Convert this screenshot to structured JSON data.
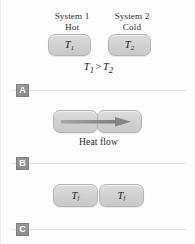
{
  "figure": {
    "title_hidden": "",
    "background_color": "#fdfdfd",
    "box_fill_color": "#d3d3d3",
    "box_border_color": "#b4b4b4",
    "tag_color": "#929292",
    "line_color": "#e3e3e3",
    "arrow_color": "#8f8f8f"
  },
  "panel_a": {
    "system1_name": "System 1",
    "system1_state": "Hot",
    "system2_name": "System 2",
    "system2_state": "Cold",
    "box1_label_base": "T",
    "box1_label_sub": "1",
    "box2_label_base": "T",
    "box2_label_sub": "2",
    "relation_left_base": "T",
    "relation_left_sub": "1",
    "relation_operator": ">",
    "relation_right_base": "T",
    "relation_right_sub": "2"
  },
  "panel_b": {
    "box1_label_base": "",
    "box2_label_base": "",
    "arrow_direction": "right",
    "caption": "Heat flow"
  },
  "panel_c": {
    "box1_label_base": "T",
    "box1_label_sub": "f",
    "box2_label_base": "T",
    "box2_label_sub": "f"
  },
  "separators": [
    {
      "tag": "A"
    },
    {
      "tag": "B"
    },
    {
      "tag": "C"
    }
  ]
}
